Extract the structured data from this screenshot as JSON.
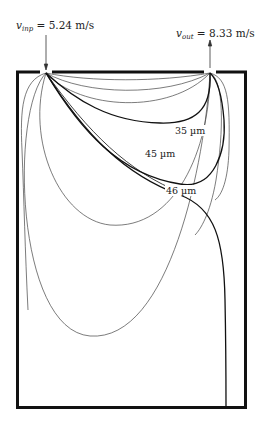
{
  "diagram": {
    "type": "particle-trajectories-in-chamber",
    "inlet": {
      "symbol": "v",
      "subscript": "inp",
      "value_text": "= 5.24 m/s"
    },
    "outlet": {
      "symbol": "v",
      "subscript": "out",
      "value_text": "= 8.33 m/s"
    },
    "particle_labels": [
      {
        "text": "35 µm"
      },
      {
        "text": "45 µm"
      },
      {
        "text": "46 µm"
      }
    ],
    "colors": {
      "wall": "#111111",
      "trajectory": "#333333",
      "highlight_trajectory": "#111111",
      "background": "#ffffff"
    }
  }
}
